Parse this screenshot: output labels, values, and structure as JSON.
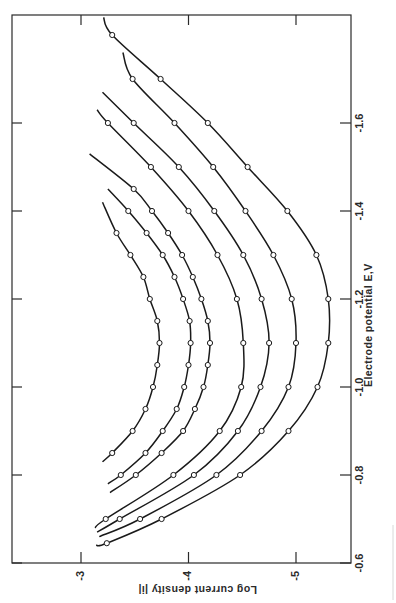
{
  "chart_data": {
    "type": "line",
    "orientation_note": "figure rotated 90° clockwise on page",
    "title": "",
    "xlabel": "Electrode potential E,V",
    "ylabel": "Log current density |i|",
    "x_ticks": [
      "-0.6",
      "-0.8",
      "-1.0",
      "-1.2",
      "-1.4",
      "-1.6"
    ],
    "y_ticks": [
      "-3",
      "-4",
      "-5"
    ],
    "xlim": [
      -0.6,
      -1.85
    ],
    "ylim": [
      -2.7,
      -5.45
    ],
    "grid": false,
    "legend": null,
    "markers": "open circles",
    "series": [
      {
        "name": "curve 1",
        "x": [
          -1.35,
          -1.3,
          -1.25,
          -1.2,
          -1.15,
          -1.1,
          -1.05,
          -1.0,
          -0.95,
          -0.9,
          -0.85
        ],
        "y": [
          -3.33,
          -3.46,
          -3.58,
          -3.64,
          -3.71,
          -3.73,
          -3.71,
          -3.67,
          -3.6,
          -3.48,
          -3.29
        ],
        "line_start": [
          -1.42,
          -3.2
        ],
        "line_end": [
          -0.83,
          -3.2
        ]
      },
      {
        "name": "curve 2",
        "x": [
          -1.4,
          -1.35,
          -1.3,
          -1.25,
          -1.2,
          -1.15,
          -1.1,
          -1.05,
          -1.0,
          -0.95,
          -0.9,
          -0.85,
          -0.8
        ],
        "y": [
          -3.44,
          -3.61,
          -3.76,
          -3.87,
          -3.95,
          -4.01,
          -4.02,
          -4.0,
          -3.96,
          -3.89,
          -3.76,
          -3.6,
          -3.37
        ],
        "line_start": [
          -1.45,
          -3.25
        ],
        "line_end": [
          -0.78,
          -3.25
        ]
      },
      {
        "name": "curve 3",
        "x": [
          -1.45,
          -1.4,
          -1.35,
          -1.3,
          -1.25,
          -1.2,
          -1.15,
          -1.1,
          -1.05,
          -1.0,
          -0.95,
          -0.9,
          -0.85,
          -0.8
        ],
        "y": [
          -3.49,
          -3.66,
          -3.81,
          -3.94,
          -4.04,
          -4.12,
          -4.18,
          -4.2,
          -4.18,
          -4.14,
          -4.06,
          -3.95,
          -3.75,
          -3.51
        ],
        "line_start": [
          -1.53,
          -3.08
        ],
        "line_end": [
          -0.76,
          -3.27
        ]
      },
      {
        "name": "curve 4",
        "x": [
          -1.6,
          -1.5,
          -1.4,
          -1.3,
          -1.2,
          -1.1,
          -1.0,
          -0.9,
          -0.8,
          -0.7
        ],
        "y": [
          -3.25,
          -3.65,
          -4.0,
          -4.27,
          -4.45,
          -4.51,
          -4.49,
          -4.29,
          -3.86,
          -3.23
        ],
        "line_start": [
          -1.63,
          -3.15
        ],
        "line_end": [
          -0.68,
          -3.13
        ]
      },
      {
        "name": "curve 5",
        "x": [
          -1.6,
          -1.5,
          -1.4,
          -1.3,
          -1.2,
          -1.1,
          -1.0,
          -0.9,
          -0.8,
          -0.7
        ],
        "y": [
          -3.49,
          -3.91,
          -4.24,
          -4.51,
          -4.68,
          -4.75,
          -4.67,
          -4.46,
          -4.05,
          -3.36
        ],
        "line_start": [
          -1.67,
          -3.2
        ],
        "line_end": [
          -0.67,
          -3.15
        ]
      },
      {
        "name": "curve 6",
        "x": [
          -1.7,
          -1.6,
          -1.5,
          -1.4,
          -1.3,
          -1.2,
          -1.1,
          -1.0,
          -0.9,
          -0.8,
          -0.7
        ],
        "y": [
          -3.48,
          -3.87,
          -4.23,
          -4.53,
          -4.79,
          -4.96,
          -5.0,
          -4.93,
          -4.68,
          -4.26,
          -3.55
        ],
        "line_start": [
          -1.76,
          -3.39
        ],
        "line_end": [
          -0.66,
          -3.17
        ]
      },
      {
        "name": "curve 7",
        "x": [
          -1.8,
          -1.7,
          -1.6,
          -1.5,
          -1.4,
          -1.3,
          -1.2,
          -1.1,
          -1.0,
          -0.9,
          -0.8,
          -0.7,
          -0.645
        ],
        "y": [
          -3.29,
          -3.74,
          -4.18,
          -4.55,
          -4.92,
          -5.19,
          -5.3,
          -5.3,
          -5.2,
          -4.93,
          -4.48,
          -3.75,
          -3.24
        ],
        "line_start": [
          -1.84,
          -3.21
        ],
        "line_end": [
          -0.64,
          -3.14
        ]
      }
    ]
  },
  "labels": {
    "x_axis_title": "Electrode potential E,V",
    "y_axis_title": "Log current density |i|"
  },
  "colors": {
    "ink": "#1a1a1a",
    "frame": "#2a2a2a",
    "background": "#ffffff"
  }
}
